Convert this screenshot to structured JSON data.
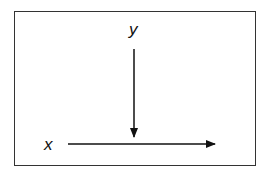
{
  "diagram": {
    "labels": {
      "y": "y",
      "x": "x"
    },
    "arrows": [
      {
        "name": "y-arrow",
        "direction": "down",
        "from": [
          134,
          49
        ],
        "to": [
          134,
          137
        ]
      },
      {
        "name": "x-arrow",
        "direction": "right",
        "from": [
          68,
          144
        ],
        "to": [
          215,
          144
        ]
      }
    ],
    "colors": {
      "stroke": "#111111",
      "border": "#333333",
      "background": "#ffffff"
    }
  }
}
